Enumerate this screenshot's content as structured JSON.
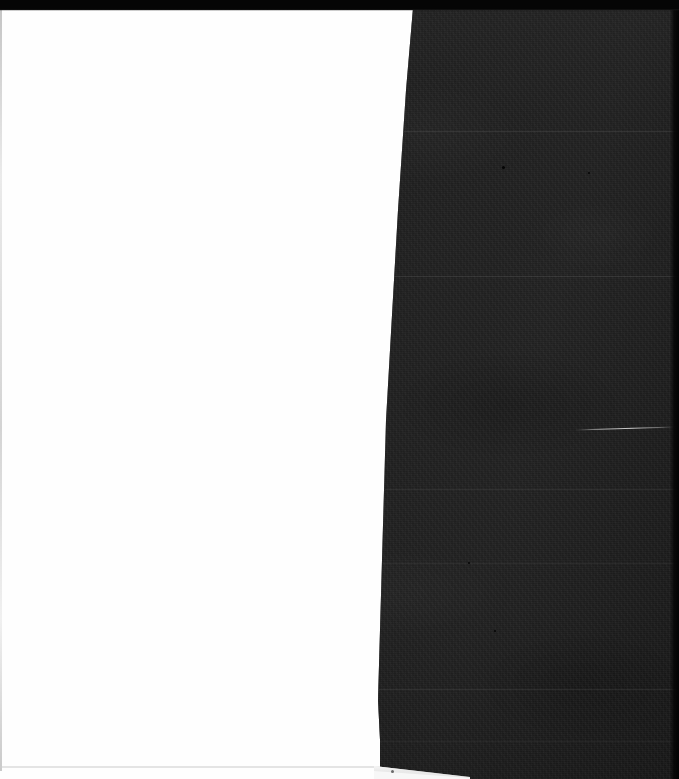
{
  "document": {
    "title": "Scanned page spread",
    "description": "Two-page scan: a blank white page on the left and a heavily underexposed dark page on the right",
    "width_px": 679,
    "height_px": 779
  },
  "regions": {
    "top_bar": {
      "name": "top black scan edge",
      "color": "#050505",
      "height_px": 10
    },
    "left_page": {
      "name": "blank white page",
      "color": "#fefefe",
      "content_text": "",
      "edge_color": "#c8c8c8"
    },
    "right_page": {
      "name": "dark underexposed page",
      "base_color": "#232323",
      "shadow_color": "#0d0d0d",
      "highlight_color": "#3a3a3a",
      "content_text": ""
    },
    "right_margin_band": {
      "name": "black right margin",
      "color": "#030303",
      "width_px": 9
    },
    "bottom_wedge": {
      "name": "white page corner wedge",
      "color": "#f7f7f7"
    },
    "scratch": {
      "name": "bright diagonal scratch",
      "color": "#e6e6e6"
    }
  },
  "seams": [
    {
      "label": "seam-1",
      "top_px": 131,
      "left_px": 404,
      "width_px": 275
    },
    {
      "label": "seam-2",
      "top_px": 276,
      "left_px": 393,
      "width_px": 286
    },
    {
      "label": "seam-3",
      "top_px": 489,
      "left_px": 385,
      "width_px": 294
    },
    {
      "label": "seam-4",
      "top_px": 563,
      "left_px": 383,
      "width_px": 296
    },
    {
      "label": "seam-5",
      "top_px": 689,
      "left_px": 379,
      "width_px": 300
    },
    {
      "label": "seam-6",
      "top_px": 741,
      "left_px": 379,
      "width_px": 300
    }
  ],
  "specks": [
    {
      "label": "speck-1",
      "left_px": 502,
      "top_px": 166,
      "size_px": 3
    },
    {
      "label": "speck-2",
      "left_px": 588,
      "top_px": 172,
      "size_px": 2
    },
    {
      "label": "speck-3",
      "left_px": 494,
      "top_px": 630,
      "size_px": 2
    },
    {
      "label": "speck-4",
      "left_px": 468,
      "top_px": 562,
      "size_px": 2
    }
  ]
}
